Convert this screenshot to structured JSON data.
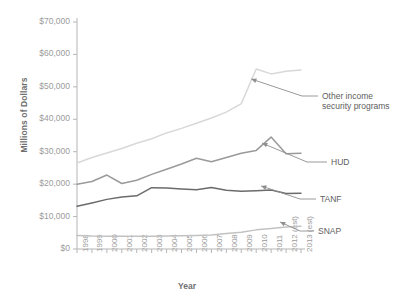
{
  "chart_data": {
    "type": "line",
    "title": "",
    "xlabel": "Year",
    "ylabel": "Millions of Dollars",
    "ylim": [
      0,
      70000
    ],
    "ytick_labels": [
      "$70,000",
      "$60,000",
      "$50,000",
      "$40,000",
      "$30,000",
      "$20,000",
      "$10,000",
      "$0"
    ],
    "ytick_values": [
      70000,
      60000,
      50000,
      40000,
      30000,
      20000,
      10000,
      0
    ],
    "grid": false,
    "legend_position": "inline-callouts",
    "categories": [
      "1998",
      "1999",
      "2000",
      "2001",
      "2002",
      "2003",
      "2004",
      "2005",
      "2006",
      "2007",
      "2008",
      "2009",
      "2010",
      "2011",
      "2012 (est)",
      "2013 (est)"
    ],
    "x": [
      1998,
      1999,
      2000,
      2001,
      2002,
      2003,
      2004,
      2005,
      2006,
      2007,
      2008,
      2009,
      2010,
      2011,
      2012,
      2013
    ],
    "series": [
      {
        "name": "Other income security programs",
        "color": "#d8d8d8",
        "values": [
          26500,
          28200,
          29600,
          31000,
          32600,
          34000,
          35800,
          37200,
          38800,
          40400,
          42200,
          44800,
          55500,
          54000,
          54800,
          55200
        ]
      },
      {
        "name": "HUD",
        "color": "#9a9a9a",
        "values": [
          20000,
          20800,
          22800,
          20200,
          21200,
          23000,
          24600,
          26200,
          28000,
          26900,
          28200,
          29500,
          30400,
          34500,
          29400,
          29500
        ]
      },
      {
        "name": "TANF",
        "color": "#6b6b6b",
        "values": [
          13200,
          14200,
          15300,
          16000,
          16400,
          18900,
          18800,
          18500,
          18300,
          19000,
          18100,
          17800,
          18000,
          18200,
          17100,
          17200
        ]
      },
      {
        "name": "SNAP",
        "color": "#c2c2c2",
        "values": [
          4200,
          4000,
          3950,
          3900,
          3900,
          3950,
          4000,
          4100,
          4200,
          4300,
          4800,
          5200,
          5900,
          6300,
          6800,
          7000
        ]
      }
    ],
    "annotations": [
      {
        "text": "Other income\nsecurity programs",
        "series": "Other income security programs"
      },
      {
        "text": "HUD",
        "series": "HUD"
      },
      {
        "text": "TANF",
        "series": "TANF"
      },
      {
        "text": "SNAP",
        "series": "SNAP"
      }
    ]
  },
  "axis": {
    "y_title": "Millions of Dollars",
    "x_title": "Year"
  },
  "labels": {
    "other": "Other income",
    "other2": "security programs",
    "hud": "HUD",
    "tanf": "TANF",
    "snap": "SNAP"
  }
}
